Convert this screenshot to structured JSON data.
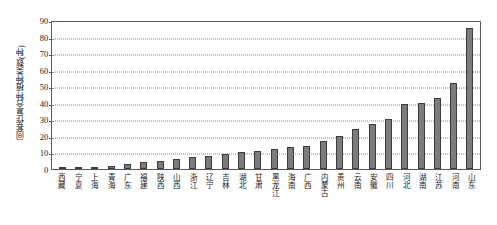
{
  "chart_data": {
    "type": "bar",
    "title": "",
    "xlabel": "",
    "ylabel": "间套作复合种植种类数(种)",
    "ylim": [
      0,
      90
    ],
    "ytick_step": 10,
    "yticks": [
      0,
      10,
      20,
      30,
      40,
      50,
      60,
      70,
      80,
      90
    ],
    "grid": true,
    "legend": "none",
    "bar_color": "#7b7b7b",
    "bar_border_color": "#3d3d3d",
    "categories": [
      "西藏",
      "宁夏",
      "上海",
      "青海",
      "广东",
      "福建",
      "陕西",
      "山西",
      "浙江",
      "辽宁",
      "吉林",
      "湖北",
      "甘肃",
      "黑龙江",
      "海南",
      "广西",
      "内蒙古",
      "贵州",
      "云南",
      "安徽",
      "四川",
      "河北",
      "湖南",
      "江苏",
      "河南",
      "山东"
    ],
    "values": [
      1,
      1,
      1,
      2,
      3,
      4,
      5,
      6,
      7,
      8,
      9,
      10,
      11,
      12,
      13,
      14,
      17,
      20,
      24,
      27,
      30,
      39,
      40,
      43,
      52,
      85
    ]
  }
}
